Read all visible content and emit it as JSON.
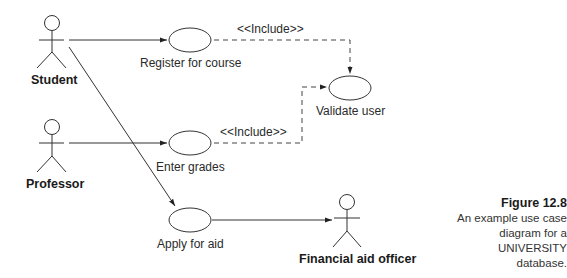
{
  "actors": [
    {
      "id": "student",
      "label": "Student"
    },
    {
      "id": "professor",
      "label": "Professor"
    },
    {
      "id": "financial_aid_officer",
      "label": "Financial aid officer"
    }
  ],
  "use_cases": [
    {
      "id": "register",
      "label": "Register for course"
    },
    {
      "id": "validate",
      "label": "Validate user"
    },
    {
      "id": "grades",
      "label": "Enter grades"
    },
    {
      "id": "aid",
      "label": "Apply for aid"
    }
  ],
  "relationships": [
    {
      "from": "student",
      "to": "register",
      "type": "association"
    },
    {
      "from": "student",
      "to": "aid",
      "type": "association"
    },
    {
      "from": "professor",
      "to": "grades",
      "type": "association"
    },
    {
      "from": "aid",
      "to": "financial_aid_officer",
      "type": "association"
    },
    {
      "from": "register",
      "to": "validate",
      "type": "include",
      "label": "<<Include>>"
    },
    {
      "from": "grades",
      "to": "validate",
      "type": "include",
      "label": "<<Include>>"
    }
  ],
  "caption": {
    "figure": "Figure 12.8",
    "line1": "An example use case",
    "line2": "diagram for a",
    "line3": "UNIVERSITY database."
  }
}
